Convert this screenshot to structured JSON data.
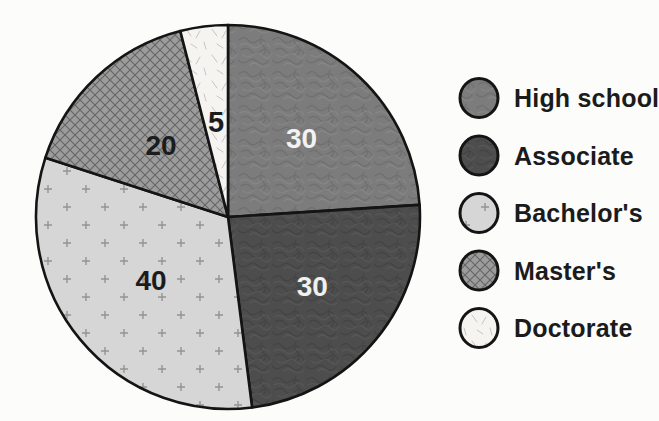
{
  "figure": {
    "background": "#fcfcfa",
    "outline_color": "#141414",
    "legend_text_color": "#1b1b1b"
  },
  "chart_data": {
    "type": "pie",
    "title": "",
    "legend_position": "right",
    "start_angle_deg": 0,
    "direction": "clockwise",
    "grid": false,
    "categories": [
      "High school",
      "Associate",
      "Bachelor's",
      "Master's",
      "Doctorate"
    ],
    "values": [
      30,
      30,
      40,
      20,
      5
    ],
    "slices": [
      {
        "label": "High school",
        "value": 30,
        "value_text": "30",
        "pattern": "mottle-mid",
        "base_color": "#7c7c7c",
        "pattern_dark": "#676767",
        "pattern_light": "#8f8f8f",
        "value_label_color": "#f2f2f2"
      },
      {
        "label": "Associate",
        "value": 30,
        "value_text": "30",
        "pattern": "mottle-dark",
        "base_color": "#4d4d4d",
        "pattern_dark": "#3d3d3d",
        "pattern_light": "#606060",
        "value_label_color": "#f0f0f0"
      },
      {
        "label": "Bachelor's",
        "value": 40,
        "value_text": "40",
        "pattern": "plus-light",
        "base_color": "#d6d6d6",
        "pattern_dark": "#8c8c8c",
        "pattern_light": "#e2e2e2",
        "value_label_color": "#1c1c1c"
      },
      {
        "label": "Master's",
        "value": 20,
        "value_text": "20",
        "pattern": "crosshatch",
        "base_color": "#9c9c9c",
        "pattern_dark": "#565656",
        "pattern_light": "#a8a8a8",
        "value_label_color": "#1c1c1c"
      },
      {
        "label": "Doctorate",
        "value": 5,
        "value_text": "5",
        "pattern": "speckle-light",
        "base_color": "#f5f4f1",
        "pattern_dark": "#bfbfbf",
        "pattern_light": "#ffffff",
        "value_label_color": "#1c1c1c"
      }
    ]
  }
}
